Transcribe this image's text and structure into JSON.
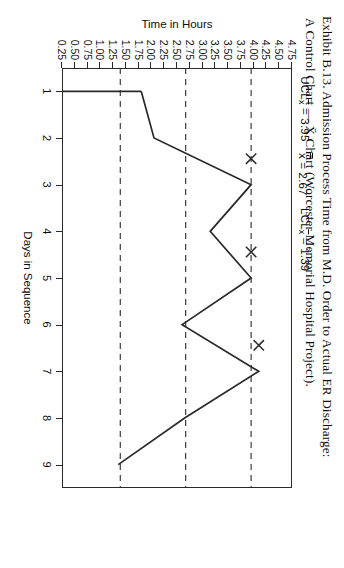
{
  "caption": {
    "line1": "Exhibit B.13. Admission Process Time from M.D. Order to Actual ER Discharge:",
    "line2": "A Control Chart — X̄ Chart (Worcester Memorial Hospital Project)."
  },
  "axes": {
    "x_title": "Days in Sequence",
    "y_title": "Time in Hours",
    "x_ticks": [
      "1",
      "2",
      "3",
      "4",
      "5",
      "6",
      "7",
      "8",
      "9"
    ],
    "y_ticks": [
      "4.75",
      "4.50",
      "4.25",
      "4.00",
      "3.75",
      "3.50",
      "3.25",
      "3.00",
      "2.75",
      "2.50",
      "2.25",
      "2.00",
      "1.75",
      "1.50",
      "1.25",
      "1.00",
      "0.75",
      "0.50",
      "0.25"
    ]
  },
  "limits": {
    "ucl": {
      "prefix": "UCL",
      "sub": "x",
      "value": "3.95",
      "text": "UCLx̄ = 3.95",
      "y": 3.95
    },
    "center": {
      "prefix": "",
      "sub": "",
      "value": "2.67",
      "text": "x̿ = 2.67",
      "y": 2.67
    },
    "lcl": {
      "prefix": "LCL",
      "sub": "x",
      "value": "1.39",
      "text": "LCLx̄ = 1.39",
      "y": 1.39
    }
  },
  "colors": {
    "line": "#2a2a2a",
    "frame": "#2a2a2a",
    "text": "#0d0d0d",
    "background": "#ffffff"
  },
  "chart_data": {
    "type": "line",
    "title": "Exhibit B.13. Admission Process Time from M.D. Order to Actual ER Discharge: A Control Chart — X̄ Chart (Worcester Memorial Hospital Project).",
    "xlabel": "Days in Sequence",
    "ylabel": "Time in Hours",
    "x": [
      1,
      2,
      3,
      4,
      5,
      6,
      7,
      8,
      9
    ],
    "values": [
      1.8,
      2.05,
      3.95,
      3.15,
      3.95,
      2.6,
      4.1,
      2.65,
      1.35
    ],
    "xlim": [
      0.5,
      9.5
    ],
    "ylim": [
      0.25,
      4.75
    ],
    "grid": false,
    "legend": null,
    "markers": {
      "symbol": "X",
      "at_x": [
        3,
        5,
        7
      ],
      "note": "out-of-control points flagged with X"
    },
    "control_limits": {
      "UCL": 3.95,
      "center": 2.67,
      "LCL": 1.39
    }
  }
}
